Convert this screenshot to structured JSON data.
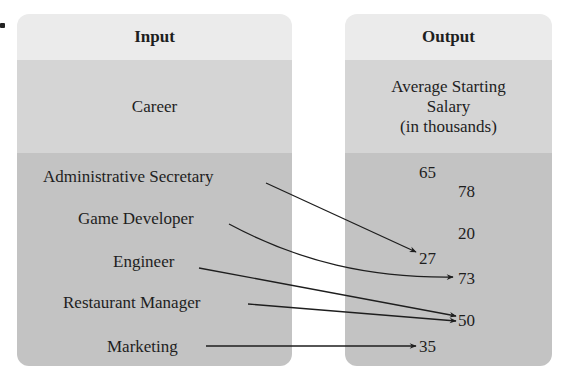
{
  "input": {
    "header": "Input",
    "subheader": "Career",
    "items": [
      "Administrative Secretary",
      "Game Developer",
      "Engineer",
      "Restaurant Manager",
      "Marketing"
    ]
  },
  "output": {
    "header": "Output",
    "subheader_lines": [
      "Average Starting",
      "Salary",
      "(in thousands)"
    ],
    "values": [
      "65",
      "78",
      "20",
      "27",
      "73",
      "50",
      "35"
    ]
  },
  "mappings": [
    {
      "from": "Administrative Secretary",
      "to": "27"
    },
    {
      "from": "Game Developer",
      "to": "73"
    },
    {
      "from": "Engineer",
      "to": "50"
    },
    {
      "from": "Restaurant Manager",
      "to": "50"
    },
    {
      "from": "Marketing",
      "to": "35"
    }
  ]
}
